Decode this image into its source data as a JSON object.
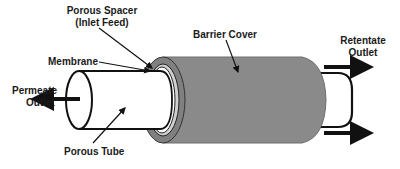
{
  "diagram": {
    "labels": {
      "porous_spacer_line1": "Porous Spacer",
      "porous_spacer_line2": "(Inlet Feed)",
      "barrier_cover": "Barrier Cover",
      "retentate_line1": "Retentate",
      "retentate_line2": "Outlet",
      "membrane": "Membrane",
      "permeate_line1": "Permeate",
      "permeate_line2": "Outlet",
      "porous_tube": "Porous Tube"
    },
    "colors": {
      "barrier_cover": "#8a8a8a",
      "barrier_edge": "#777777",
      "outline": "#111111",
      "background": "#ffffff"
    }
  }
}
